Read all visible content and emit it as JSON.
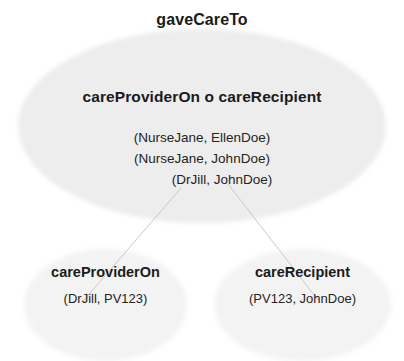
{
  "diagram": {
    "type": "set-composition-venn-diagram",
    "background_color": "#ffffff",
    "main_set": {
      "title": "gaveCareTo",
      "composition_label": "careProviderOn  o  careRecipient",
      "fill_color": "#ededed",
      "tuples": [
        "(NurseJane, EllenDoe)",
        "(NurseJane, JohnDoe)",
        "(DrJill, JohnDoe)"
      ]
    },
    "sub_sets": [
      {
        "name": "careProviderOn",
        "tuple": "(DrJill, PV123)",
        "fill_color": "#f3f3f3"
      },
      {
        "name": "careRecipient",
        "tuple": "(PV123, JohnDoe)",
        "fill_color": "#f3f3f3"
      }
    ],
    "connectors": {
      "stroke_color": "#c9c9c9",
      "count": 2
    },
    "text_color": "#1b1b1b"
  }
}
